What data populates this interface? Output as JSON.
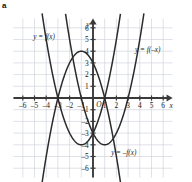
{
  "panel": {
    "letter": "a"
  },
  "chart_data": {
    "type": "line",
    "title": "",
    "xlabel": "x",
    "ylabel": "y",
    "xlim": [
      -6.8,
      6.8
    ],
    "ylim": [
      -6.8,
      6.8
    ],
    "grid": true,
    "grid_step": 1,
    "origin_label": "O",
    "legend_position": "inline-annotations",
    "x_ticks": [
      -6,
      -5,
      -4,
      -3,
      -2,
      -1,
      1,
      2,
      3,
      4,
      5,
      6
    ],
    "x_tick_labels": [
      "–6",
      "–5",
      "–4",
      "–3",
      "–2",
      "–1",
      "1",
      "2",
      "3",
      "4",
      "5",
      "6"
    ],
    "y_ticks": [
      6,
      5,
      4,
      3,
      2,
      1,
      -1,
      -2,
      -3,
      -4,
      -5,
      -6
    ],
    "y_tick_labels": [
      "6",
      "5",
      "4",
      "3",
      "2",
      "1",
      "–1",
      "–2",
      "–3",
      "–4",
      "–5",
      "–6"
    ],
    "series": [
      {
        "name": "y = f(x)",
        "label": "y = f(x)",
        "expression": "x^2 + 2x - 3",
        "vertex": [
          -1,
          -4
        ],
        "roots": [
          -3,
          1
        ],
        "y_intercept": -3,
        "label_position": [
          -5.1,
          5.05
        ]
      },
      {
        "name": "y = f(-x)",
        "label": "y = f(–x)",
        "expression": "x^2 - 2x - 3",
        "vertex": [
          1,
          -4
        ],
        "roots": [
          -1,
          3
        ],
        "y_intercept": -3,
        "label_position": [
          3.6,
          3.95
        ]
      },
      {
        "name": "y = -f(x)",
        "label": "y = –f(x)",
        "expression": "-x^2 - 2x + 3",
        "vertex": [
          -1,
          4
        ],
        "roots": [
          -3,
          1
        ],
        "y_intercept": 3,
        "label_position": [
          1.55,
          -4.85
        ]
      }
    ]
  }
}
